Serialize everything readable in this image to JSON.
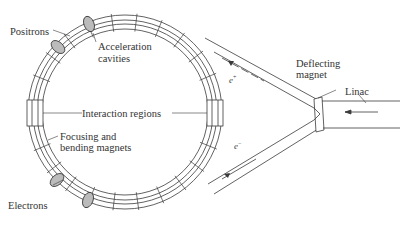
{
  "diagram": {
    "labels": {
      "positrons": "Positrons",
      "acceleration_line1": "Acceleration",
      "acceleration_line2": "cavities",
      "interaction": "Interaction regions",
      "focusing_line1": "Focusing and",
      "focusing_line2": "bending magnets",
      "electrons": "Electrons",
      "deflecting_line1": "Deflecting",
      "deflecting_line2": "magnet",
      "linac": "Linac"
    },
    "beam_symbols": {
      "positron": "e",
      "positron_charge": "+",
      "electron": "e",
      "electron_charge": "−"
    },
    "colors": {
      "line": "#3a3a3a",
      "background": "#ffffff",
      "text": "#333333"
    }
  }
}
